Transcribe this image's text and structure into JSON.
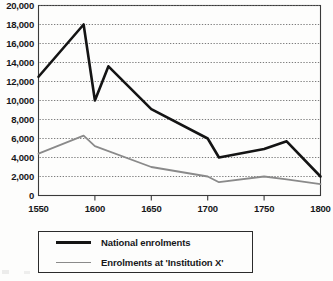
{
  "chart_data": {
    "type": "line",
    "title": "",
    "xlabel": "",
    "ylabel": "",
    "xlim": [
      1550,
      1800
    ],
    "ylim": [
      0,
      20000
    ],
    "grid": true,
    "grid_style": "dotted-horizontal",
    "legend_position": "below-plot",
    "xticks": [
      1550,
      1600,
      1650,
      1700,
      1750,
      1800
    ],
    "xtick_labels": [
      "1550",
      "1600",
      "1650",
      "1700",
      "1750",
      "1800"
    ],
    "yticks": [
      0,
      2000,
      4000,
      6000,
      8000,
      10000,
      12000,
      14000,
      16000,
      18000,
      20000
    ],
    "ytick_labels": [
      "0",
      "2,000",
      "4,000",
      "6,000",
      "8,000",
      "10,000",
      "12,000",
      "14,000",
      "16,000",
      "18,000",
      "20,000"
    ],
    "series": [
      {
        "name": "National enrolments",
        "color": "#141414",
        "width": 2.6,
        "x": [
          1550,
          1590,
          1600,
          1612,
          1650,
          1700,
          1710,
          1750,
          1770,
          1800
        ],
        "values": [
          12500,
          18000,
          10000,
          13600,
          9100,
          6000,
          4000,
          4900,
          5700,
          2000
        ]
      },
      {
        "name": "Enrolments at 'Institution X'",
        "color": "#8a8a8a",
        "width": 1.8,
        "x": [
          1550,
          1590,
          1600,
          1650,
          1700,
          1710,
          1750,
          1770,
          1800
        ],
        "values": [
          4400,
          6300,
          5200,
          3000,
          2000,
          1400,
          2000,
          1700,
          1200
        ]
      }
    ]
  },
  "legend": {
    "items": [
      {
        "label": "National enrolments",
        "swatch": "national"
      },
      {
        "label": "Enrolments at 'Institution X'",
        "swatch": "institution"
      }
    ]
  }
}
